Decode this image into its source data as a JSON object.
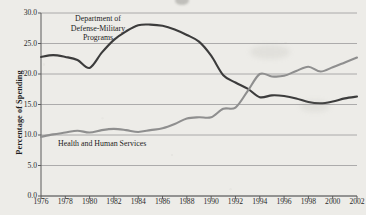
{
  "chart_data": {
    "type": "line",
    "title": "",
    "xlabel": "",
    "ylabel": "Percentage of Spending",
    "x": [
      1976,
      1977,
      1978,
      1979,
      1980,
      1981,
      1982,
      1983,
      1984,
      1985,
      1986,
      1987,
      1988,
      1989,
      1990,
      1991,
      1992,
      1993,
      1994,
      1995,
      1996,
      1997,
      1998,
      1999,
      2000,
      2001,
      2002
    ],
    "xlim": [
      1976,
      2002
    ],
    "ylim": [
      0.0,
      30.0
    ],
    "yticks": [
      "0.0",
      "5.0",
      "10.0",
      "15.0",
      "20.0",
      "25.0",
      "30.0"
    ],
    "ytick_values": [
      0.0,
      5.0,
      10.0,
      15.0,
      20.0,
      25.0,
      30.0
    ],
    "xticks": [
      "1976",
      "1978",
      "1980",
      "1982",
      "1984",
      "1986",
      "1988",
      "1990",
      "1992",
      "1994",
      "1996",
      "1998",
      "2000",
      "2002"
    ],
    "xtick_values": [
      1976,
      1978,
      1980,
      1982,
      1984,
      1986,
      1988,
      1990,
      1992,
      1994,
      1996,
      1998,
      2000,
      2002
    ],
    "grid": true,
    "grid_axis": "y",
    "legend": "annotations-inline",
    "series": [
      {
        "name": "Department of Defense-Military Programs",
        "color": "#3c3c3c",
        "values": [
          22.8,
          23.1,
          22.8,
          22.3,
          21.0,
          23.5,
          25.6,
          27.0,
          28.0,
          28.1,
          27.9,
          27.3,
          26.4,
          25.3,
          23.0,
          19.8,
          18.6,
          17.6,
          16.2,
          16.5,
          16.4,
          16.0,
          15.4,
          15.2,
          15.5,
          16.0,
          16.3
        ]
      },
      {
        "name": "Health and Human Services",
        "color": "#8f8f8f",
        "values": [
          9.7,
          10.1,
          10.4,
          10.7,
          10.4,
          10.8,
          11.0,
          10.8,
          10.5,
          10.8,
          11.1,
          11.8,
          12.7,
          12.9,
          12.9,
          14.3,
          14.5,
          17.2,
          20.0,
          19.6,
          19.7,
          20.5,
          21.2,
          20.4,
          21.1,
          21.9,
          22.7
        ]
      }
    ],
    "annotations": [
      {
        "id": "dod",
        "text": "Department of\nDefense-Military\nPrograms",
        "x": 1979.5,
        "y": 29.0
      },
      {
        "id": "hhs",
        "text": "Health and Human Services",
        "x": 1980.0,
        "y": 8.0
      }
    ]
  },
  "colors": {
    "background": "#edece8",
    "axis": "#5a5a5a",
    "grid": "#9a9a9a",
    "text": "#1d1d1d",
    "dod_line": "#3c3c3c",
    "hhs_line": "#8f8f8f"
  }
}
